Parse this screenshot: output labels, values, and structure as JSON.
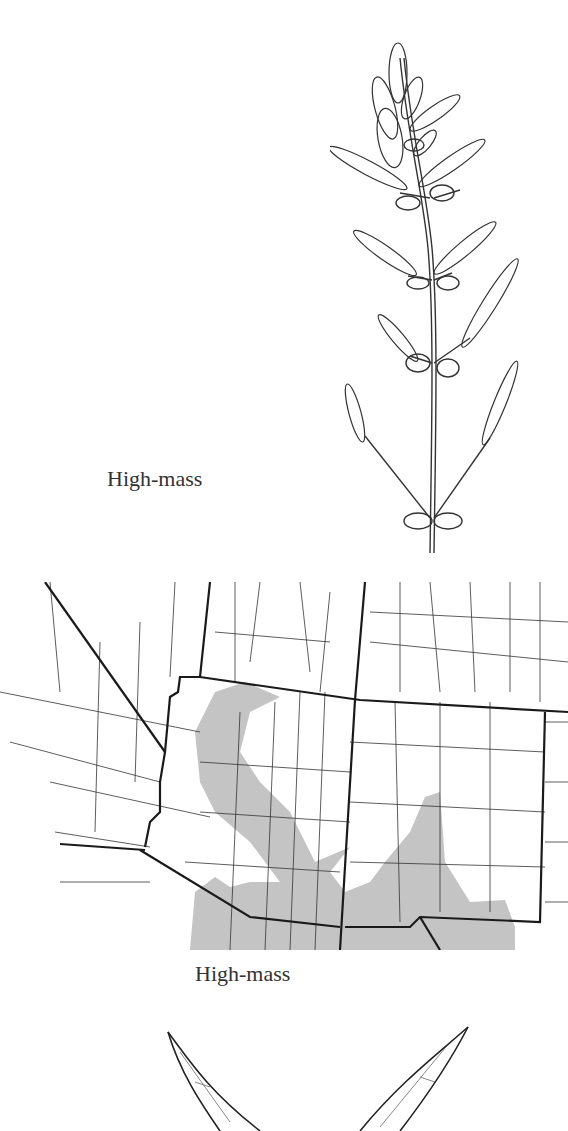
{
  "page": {
    "illustration": {
      "caption": "High-mass",
      "subject": "plant-sprig-illustration"
    },
    "range_map": {
      "caption": "High-mass",
      "shade_color": "#c4c4c4",
      "line_color": "#222222",
      "subject": "distribution-range-map"
    },
    "leaf_illustration": {
      "subject": "leaf-illustration"
    }
  }
}
